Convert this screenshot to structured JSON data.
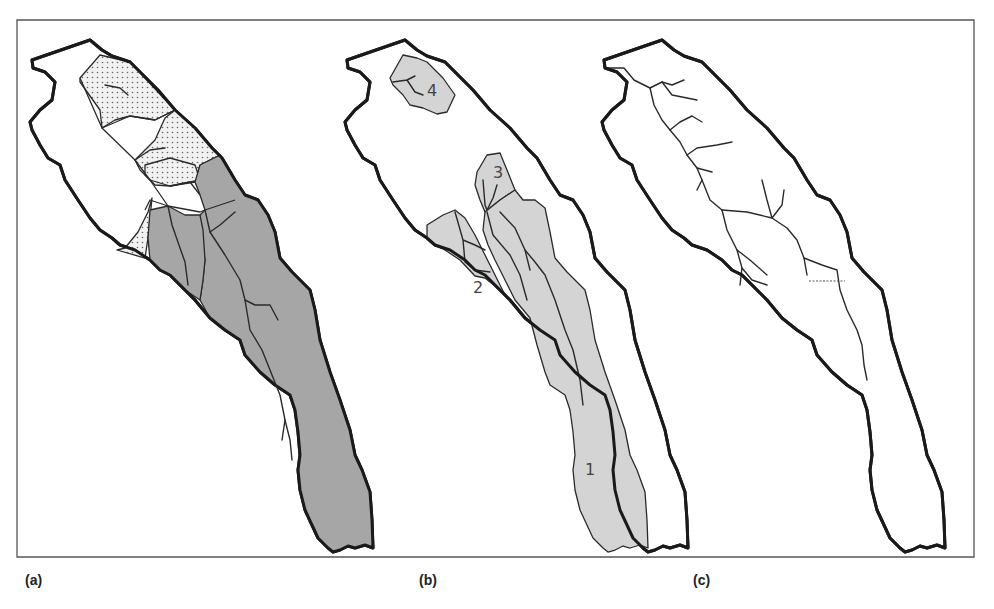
{
  "figure": {
    "panels": [
      {
        "id": "a",
        "label": "(a)",
        "description": "Catchment subdivided into stippled and dark grey sub-areas with channel network"
      },
      {
        "id": "b",
        "label": "(b)",
        "description": "Catchment with four numbered sub-catchments shaded light grey",
        "subcatchment_labels": [
          "1",
          "2",
          "3",
          "4"
        ]
      },
      {
        "id": "c",
        "label": "(c)",
        "description": "Catchment outline with full channel network; dotted line marks a cross-section"
      }
    ],
    "colors": {
      "dark_fill": "#a6a6a6",
      "light_fill": "#d4d4d4",
      "stipple_bg": "#f1f1f1",
      "outline": "#1a1a1a",
      "frame": "#555555"
    }
  }
}
